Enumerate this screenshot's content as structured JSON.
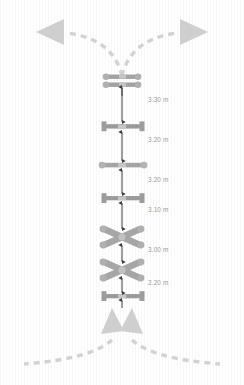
{
  "diagram": {
    "background_color": "#ffffff",
    "texture": "vertical-stripes",
    "symbol_color": "#9e9e9e",
    "symbol_color_dark": "#8a8a8a",
    "symbol_color_light": "#c9c9c9",
    "arrow_color": "#cfcfcf",
    "dimension_color": "#4a4a4a",
    "label_color": "#9a9a9a",
    "canvas": {
      "width": 244,
      "height": 385
    }
  },
  "routes": {
    "top_left_arrow": {
      "name": "route-exit-left",
      "direction": "left"
    },
    "top_right_arrow": {
      "name": "route-exit-right",
      "direction": "right"
    },
    "bottom_left_arrow": {
      "name": "route-entry-left",
      "direction": "up"
    },
    "bottom_right_arrow": {
      "name": "route-entry-right",
      "direction": "up"
    }
  },
  "track_elements": [
    {
      "id": 1,
      "type": "double-sleeper",
      "end_cap": "round",
      "y": 78
    },
    {
      "id": 2,
      "type": "turnout",
      "end_cap": "square",
      "y": 126
    },
    {
      "id": 3,
      "type": "turnout",
      "end_cap": "round",
      "y": 165
    },
    {
      "id": 4,
      "type": "turnout",
      "end_cap": "square",
      "y": 198
    },
    {
      "id": 5,
      "type": "crossover-x",
      "end_cap": "round",
      "y": 237
    },
    {
      "id": 6,
      "type": "crossover-x",
      "end_cap": "round",
      "y": 270
    },
    {
      "id": 7,
      "type": "turnout",
      "end_cap": "square",
      "y": 296
    }
  ],
  "dimensions": [
    {
      "id": "d1",
      "value": "3.30 m",
      "from_y": 86,
      "to_y": 122,
      "label_y": 99,
      "label_x": 148
    },
    {
      "id": "d2",
      "value": "3.20 m",
      "from_y": 131,
      "to_y": 161,
      "label_y": 139,
      "label_x": 148
    },
    {
      "id": "d3",
      "value": "3.20 m",
      "from_y": 170,
      "to_y": 194,
      "label_y": 178,
      "label_x": 148
    },
    {
      "id": "d4",
      "value": "3.10 m",
      "from_y": 203,
      "to_y": 231,
      "label_y": 209,
      "label_x": 148
    },
    {
      "id": "d5",
      "value": "3.00 m",
      "from_y": 243,
      "to_y": 265,
      "label_y": 248,
      "label_x": 148
    },
    {
      "id": "d6",
      "value": "2.20 m",
      "from_y": 276,
      "to_y": 292,
      "label_y": 281,
      "label_x": 148
    }
  ]
}
